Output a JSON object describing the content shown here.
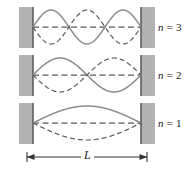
{
  "figure": {
    "width": 191,
    "height": 169,
    "background": "#ffffff",
    "colors": {
      "wall_fill": "#b3b3b3",
      "wall_edge": "#4d4d4d",
      "wave_solid": "#8c8c8c",
      "wave_dashed": "#595959",
      "axis_dashed": "#595959",
      "dimension_line": "#333333",
      "text": "#1a1a1a"
    },
    "string": {
      "left_x": 33,
      "right_x": 141,
      "length_px": 108
    }
  },
  "modes": [
    {
      "id": "mode-n3",
      "label_n": "n",
      "label_eq": "=",
      "label_value": "3",
      "label_full": "n = 3",
      "harmonic": 3,
      "antinodes": 3,
      "nodes": 4,
      "axis_y": 27,
      "amplitude": 17,
      "wall_top": 7,
      "wall_height": 41,
      "label_x": 158,
      "label_y": 21
    },
    {
      "id": "mode-n2",
      "label_n": "n",
      "label_eq": "=",
      "label_value": "2",
      "label_full": "n = 2",
      "harmonic": 2,
      "antinodes": 2,
      "nodes": 3,
      "axis_y": 75,
      "amplitude": 17,
      "wall_top": 55,
      "wall_height": 41,
      "label_x": 158,
      "label_y": 69
    },
    {
      "id": "mode-n1",
      "label_n": "n",
      "label_eq": "=",
      "label_value": "1",
      "label_full": "n = 1",
      "harmonic": 1,
      "antinodes": 1,
      "nodes": 2,
      "axis_y": 123,
      "amplitude": 17,
      "wall_top": 103,
      "wall_height": 41,
      "label_x": 158,
      "label_y": 117
    }
  ],
  "dimension": {
    "label": "L",
    "y": 157,
    "left_x": 27,
    "right_x": 147,
    "label_x": 81,
    "label_y": 149,
    "arrow_left_name": "left-arrowhead",
    "arrow_right_name": "right-arrowhead"
  }
}
